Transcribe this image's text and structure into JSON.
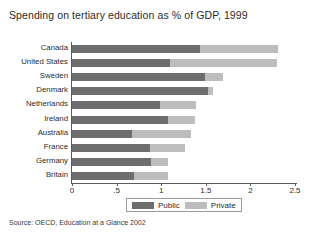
{
  "chart_data": {
    "type": "bar",
    "orientation": "horizontal",
    "stacked": true,
    "title": "Spending on tertiary education as % of GDP, 1999",
    "xlabel": "",
    "ylabel": "",
    "xlim": [
      0,
      2.5
    ],
    "grid": false,
    "legend_position": "bottom",
    "source": "Source:  OECD, Education at a Glance 2002",
    "xticks": [
      {
        "value": 0,
        "label": "0"
      },
      {
        "value": 0.5,
        "label": ".5"
      },
      {
        "value": 1,
        "label": "1"
      },
      {
        "value": 1.5,
        "label": "1.5"
      },
      {
        "value": 2,
        "label": "2"
      },
      {
        "value": 2.5,
        "label": "2.5"
      }
    ],
    "categories": [
      "Canada",
      "United States",
      "Sweden",
      "Denmark",
      "Netherlands",
      "Ireland",
      "Australia",
      "France",
      "Germany",
      "Britain"
    ],
    "series": [
      {
        "name": "Public",
        "color": "#6e6e6e",
        "values": [
          1.44,
          1.1,
          1.49,
          1.53,
          0.99,
          1.08,
          0.67,
          0.88,
          0.89,
          0.69
        ]
      },
      {
        "name": "Private",
        "color": "#bdbdbd",
        "values": [
          0.87,
          1.2,
          0.2,
          0.05,
          0.4,
          0.3,
          0.66,
          0.39,
          0.19,
          0.39
        ]
      }
    ],
    "totals": [
      2.31,
      2.3,
      1.69,
      1.58,
      1.39,
      1.38,
      1.33,
      1.27,
      1.08,
      1.08
    ]
  }
}
